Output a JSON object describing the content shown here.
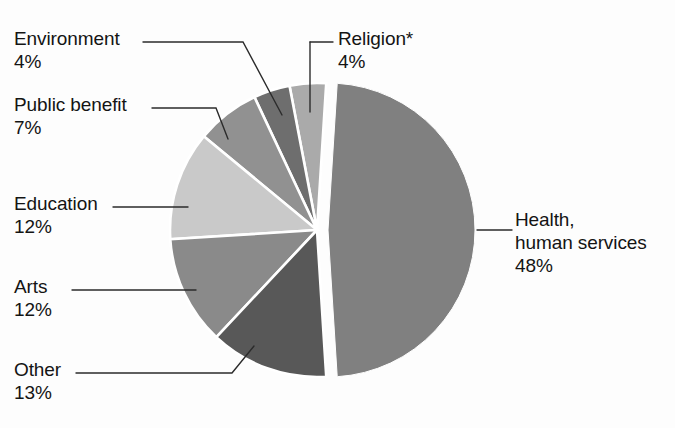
{
  "chart_data": {
    "type": "pie",
    "title": "",
    "subtitle": "",
    "xlabel": "",
    "ylabel": "",
    "legend_position": "callout-labels",
    "grid": false,
    "units": "percent",
    "footnote_marker": "*",
    "start_angle_deg": 90,
    "direction": "counterclockwise",
    "exploded_slice": "Health, human services",
    "categories": [
      "Health, human services",
      "Other",
      "Arts",
      "Education",
      "Public benefit",
      "Environment",
      "Religion*"
    ],
    "values": [
      48,
      13,
      12,
      12,
      7,
      4,
      4
    ],
    "slices": [
      {
        "id": "health",
        "label_lines": [
          "Health,",
          "human services"
        ],
        "label": "Health, human services",
        "value": 48,
        "percent_text": "48%",
        "color": "#808080",
        "exploded": true
      },
      {
        "id": "other",
        "label_lines": [
          "Other"
        ],
        "label": "Other",
        "value": 13,
        "percent_text": "13%",
        "color": "#585858",
        "exploded": false
      },
      {
        "id": "arts",
        "label_lines": [
          "Arts"
        ],
        "label": "Arts",
        "value": 12,
        "percent_text": "12%",
        "color": "#8a8a8a",
        "exploded": false
      },
      {
        "id": "education",
        "label_lines": [
          "Education"
        ],
        "label": "Education",
        "value": 12,
        "percent_text": "12%",
        "color": "#c9c9c9",
        "exploded": false
      },
      {
        "id": "public-benefit",
        "label_lines": [
          "Public benefit"
        ],
        "label": "Public benefit",
        "value": 7,
        "percent_text": "7%",
        "color": "#919191",
        "exploded": false
      },
      {
        "id": "environment",
        "label_lines": [
          "Environment"
        ],
        "label": "Environment",
        "value": 4,
        "percent_text": "4%",
        "color": "#6e6e6e",
        "exploded": false
      },
      {
        "id": "religion",
        "label_lines": [
          "Religion*"
        ],
        "label": "Religion*",
        "value": 4,
        "percent_text": "4%",
        "color": "#aaaaaa",
        "exploded": false
      }
    ]
  },
  "labels": {
    "environment": {
      "name": "Environment",
      "percent": "4%"
    },
    "public_benefit": {
      "name": "Public benefit",
      "percent": "7%"
    },
    "education": {
      "name": "Education",
      "percent": "12%"
    },
    "arts": {
      "name": "Arts",
      "percent": "12%"
    },
    "other": {
      "name": "Other",
      "percent": "13%"
    },
    "religion": {
      "name": "Religion*",
      "percent": "4%"
    },
    "health": {
      "line1": "Health,",
      "line2": "human services",
      "percent": "48%"
    }
  },
  "colors": {
    "background": "#fdfdfd",
    "text": "#141414",
    "leader_line": "#2b2b2b",
    "slice_gap": "#ffffff"
  }
}
